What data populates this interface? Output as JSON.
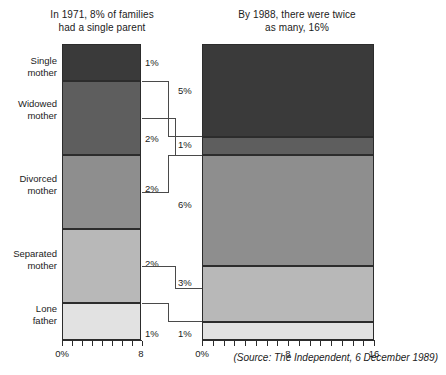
{
  "chart_data": {
    "type": "bar",
    "subtype": "stacked-bar-comparison",
    "title": "",
    "panels": [
      {
        "id": "panel-1971",
        "title": "In 1971, 8% of families had a single parent",
        "title_lines": [
          "In 1971, 8% of families",
          "had a single parent"
        ],
        "year": 1971,
        "total": "8%",
        "xlabel": "",
        "ylabel": "",
        "xlim": [
          0,
          8
        ],
        "axis_ticks": [
          0,
          1,
          2,
          3,
          4,
          5,
          6,
          7,
          8
        ],
        "axis_tick_labels": [
          {
            "value": 0,
            "label": "0%"
          },
          {
            "value": 8,
            "label": "8"
          }
        ],
        "grid": false,
        "categories": [
          "Single mother",
          "Widowed mother",
          "Divorced mother",
          "Separated mother",
          "Lone father"
        ],
        "values": [
          1,
          2,
          2,
          2,
          1
        ],
        "value_labels": [
          "1%",
          "2%",
          "2%",
          "2%",
          "1%"
        ]
      },
      {
        "id": "panel-1988",
        "title": "By 1988, there were twice as many, 16%",
        "title_lines": [
          "By 1988, there were twice",
          "as many, 16%"
        ],
        "year": 1988,
        "total": "16%",
        "xlabel": "",
        "ylabel": "",
        "xlim": [
          0,
          16
        ],
        "axis_ticks": [
          0,
          1,
          2,
          3,
          4,
          5,
          6,
          7,
          8,
          9,
          10,
          11,
          12,
          13,
          14,
          15,
          16
        ],
        "axis_tick_labels": [
          {
            "value": 0,
            "label": "0%"
          },
          {
            "value": 8,
            "label": "8"
          },
          {
            "value": 16,
            "label": "16"
          }
        ],
        "grid": false,
        "categories": [
          "Single mother",
          "Widowed mother",
          "Divorced mother",
          "Separated mother",
          "Lone father"
        ],
        "values": [
          5,
          1,
          6,
          3,
          1
        ],
        "value_labels": [
          "5%",
          "1%",
          "6%",
          "3%",
          "1%"
        ]
      }
    ],
    "series": [
      {
        "name": "Single mother",
        "values": [
          1,
          5
        ],
        "color": "#3a3a3a"
      },
      {
        "name": "Widowed mother",
        "values": [
          2,
          1
        ],
        "color": "#5e5e5e"
      },
      {
        "name": "Divorced mother",
        "values": [
          2,
          6
        ],
        "color": "#8e8e8e"
      },
      {
        "name": "Separated mother",
        "values": [
          2,
          3
        ],
        "color": "#b8b8b8"
      },
      {
        "name": "Lone father",
        "values": [
          1,
          1
        ],
        "color": "#e2e2e2"
      }
    ],
    "legend_position": "left-labels",
    "source_note": "(Source: The Independent, 6 December 1989)"
  },
  "labels": {
    "categories": [
      {
        "id": "single-mother",
        "line1": "Single",
        "line2": "mother"
      },
      {
        "id": "widowed-mother",
        "line1": "Widowed",
        "line2": "mother"
      },
      {
        "id": "divorced-mother",
        "line1": "Divorced",
        "line2": "mother"
      },
      {
        "id": "separated-mother",
        "line1": "Separated",
        "line2": "mother"
      },
      {
        "id": "lone-father",
        "line1": "Lone",
        "line2": "father"
      }
    ]
  },
  "source": {
    "prefix": "(Source: ",
    "publication": "The Independent",
    "suffix": ", 6 December 1989)",
    "full": "(Source: The Independent, 6 December 1989)"
  },
  "colors": {
    "single_mother": "#3a3a3a",
    "widowed_mother": "#5e5e5e",
    "divorced_mother": "#8e8e8e",
    "separated_mother": "#b8b8b8",
    "lone_father": "#e2e2e2",
    "outline": "#2c2c2c",
    "text": "#1b1b1b",
    "background": "#ffffff"
  }
}
